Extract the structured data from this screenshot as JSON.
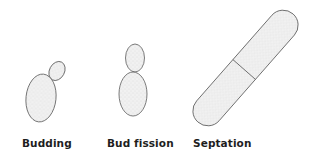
{
  "figure": {
    "panels": [
      {
        "id": "budding",
        "label": "Budding"
      },
      {
        "id": "bud-fission",
        "label": "Bud fission"
      },
      {
        "id": "septation",
        "label": "Septation"
      }
    ]
  },
  "colors": {
    "outline": "#5a5a5a",
    "cell_fill": "#efefef",
    "stipple": "#c8c8c8",
    "label_text": "#1e1e1e",
    "background": "#ffffff"
  }
}
